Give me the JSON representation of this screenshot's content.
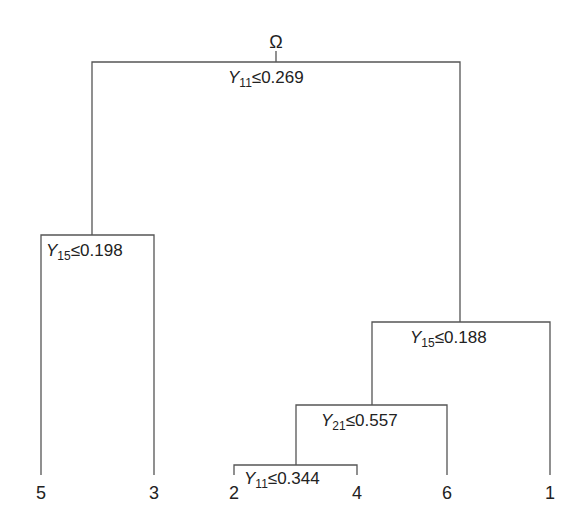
{
  "root": {
    "label": "Ω"
  },
  "splits": [
    {
      "id": "n1",
      "var": "Y",
      "sub": "11",
      "op": "≤",
      "value": "0.269"
    },
    {
      "id": "n2",
      "var": "Y",
      "sub": "15",
      "op": "≤",
      "value": "0.198"
    },
    {
      "id": "n3",
      "var": "Y",
      "sub": "15",
      "op": "≤",
      "value": "0.188"
    },
    {
      "id": "n4",
      "var": "Y",
      "sub": "21",
      "op": "≤",
      "value": "0.557"
    },
    {
      "id": "n5",
      "var": "Y",
      "sub": "11",
      "op": "≤",
      "value": "0.344"
    }
  ],
  "leaves": [
    "5",
    "3",
    "2",
    "4",
    "6",
    "1"
  ]
}
